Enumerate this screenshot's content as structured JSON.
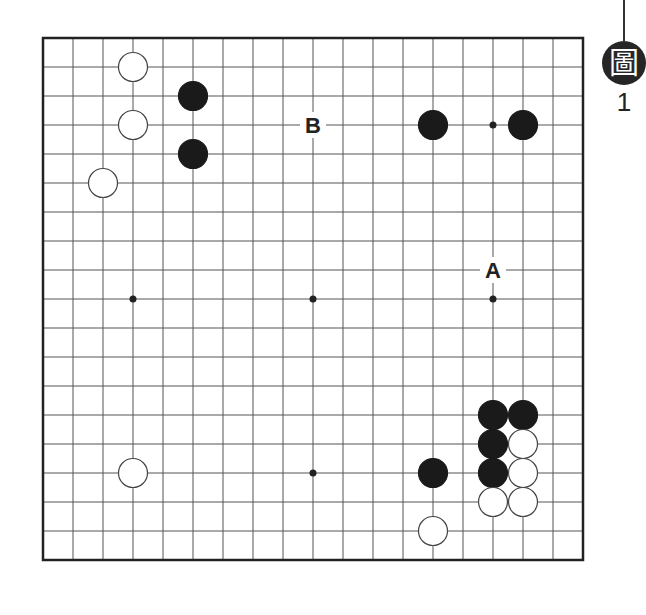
{
  "diagram": {
    "title_glyph": "圖",
    "number": "1",
    "board": {
      "size": 19,
      "origin_x": 43,
      "origin_y": 38,
      "spacing_x": 30,
      "spacing_y": 29,
      "line_color": "#555555",
      "border_color": "#222222",
      "star_points": [
        [
          3,
          9
        ],
        [
          9,
          9
        ],
        [
          15,
          9
        ],
        [
          15,
          3
        ],
        [
          9,
          15
        ]
      ],
      "stones": [
        {
          "color": "white",
          "col": 3,
          "row": 1
        },
        {
          "color": "white",
          "col": 3,
          "row": 3
        },
        {
          "color": "white",
          "col": 2,
          "row": 5
        },
        {
          "color": "black",
          "col": 5,
          "row": 2
        },
        {
          "color": "black",
          "col": 5,
          "row": 4
        },
        {
          "color": "black",
          "col": 13,
          "row": 3
        },
        {
          "color": "black",
          "col": 16,
          "row": 3
        },
        {
          "color": "white",
          "col": 3,
          "row": 15
        },
        {
          "color": "black",
          "col": 15,
          "row": 13
        },
        {
          "color": "black",
          "col": 16,
          "row": 13
        },
        {
          "color": "black",
          "col": 15,
          "row": 14
        },
        {
          "color": "white",
          "col": 16,
          "row": 14
        },
        {
          "color": "black",
          "col": 13,
          "row": 15
        },
        {
          "color": "black",
          "col": 15,
          "row": 15
        },
        {
          "color": "white",
          "col": 16,
          "row": 15
        },
        {
          "color": "white",
          "col": 15,
          "row": 16
        },
        {
          "color": "white",
          "col": 16,
          "row": 16
        },
        {
          "color": "white",
          "col": 13,
          "row": 17
        }
      ],
      "labels": [
        {
          "text": "B",
          "col": 9,
          "row": 3
        },
        {
          "text": "A",
          "col": 15,
          "row": 8
        }
      ]
    }
  }
}
